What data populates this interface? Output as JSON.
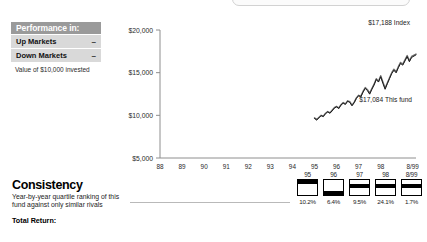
{
  "performance_panel": {
    "header": "Performance in:",
    "rows": [
      {
        "label": "Up Markets",
        "value": "–"
      },
      {
        "label": "Down Markets",
        "value": "–"
      }
    ],
    "note": "Value of $10,000 invested"
  },
  "consistency": {
    "title": "Consistency",
    "subtitle": "Year-by-year quartile ranking of this fund against only similar rivals",
    "total_return_label": "Total Return:"
  },
  "quartiles": {
    "cells": [
      {
        "year": "95",
        "quartile": 1,
        "pct": "10.2%"
      },
      {
        "year": "96",
        "quartile": 4,
        "pct": "6.4%"
      },
      {
        "year": "97",
        "quartile": 2,
        "pct": "9.5%"
      },
      {
        "year": "98",
        "quartile": 2,
        "pct": "24.1%"
      },
      {
        "year": "8/99",
        "quartile": 2,
        "pct": "1.7%"
      }
    ]
  },
  "chart_data": {
    "type": "line",
    "title": "",
    "xlabel": "",
    "ylabel": "",
    "ylim": [
      5000,
      20000
    ],
    "ytick_labels": [
      "$20,000",
      "$15,000",
      "$10,000",
      "$5,000"
    ],
    "ytick_values": [
      20000,
      15000,
      10000,
      5000
    ],
    "xtick_labels": [
      "88",
      "89",
      "90",
      "91",
      "92",
      "93",
      "94",
      "95",
      "96",
      "97",
      "98",
      "8/99"
    ],
    "grid": false,
    "legend": "annotations",
    "annotations": [
      {
        "text": "$17,188 Index",
        "value": 17188
      },
      {
        "text": "$17,084 This fund",
        "value": 17084
      }
    ],
    "series": [
      {
        "name": "Index",
        "color": "#6f6f6f",
        "x": [
          95.0,
          95.1,
          95.2,
          95.3,
          95.4,
          95.5,
          95.6,
          95.7,
          95.8,
          95.9,
          96.0,
          96.1,
          96.2,
          96.3,
          96.4,
          96.5,
          96.6,
          96.7,
          96.8,
          96.9,
          97.0,
          97.1,
          97.2,
          97.3,
          97.4,
          97.5,
          97.6,
          97.7,
          97.8,
          97.9,
          98.0,
          98.1,
          98.2,
          98.3,
          98.4,
          98.5,
          98.6,
          98.7,
          98.8,
          98.9,
          99.0,
          99.1,
          99.2,
          99.3,
          99.4,
          99.6
        ],
        "values": [
          9700,
          9500,
          9750,
          10000,
          9900,
          10250,
          10450,
          10300,
          10600,
          10900,
          11050,
          10850,
          11250,
          11500,
          11350,
          11700,
          11600,
          11200,
          11550,
          12050,
          12350,
          12250,
          12800,
          13250,
          13000,
          12600,
          13150,
          13650,
          14300,
          14000,
          14650,
          13900,
          13200,
          13800,
          14400,
          15000,
          15400,
          15100,
          15700,
          16200,
          16000,
          16500,
          17000,
          16400,
          16900,
          17188
        ]
      },
      {
        "name": "This fund",
        "color": "#1a1a1a",
        "x": [
          95.0,
          95.1,
          95.2,
          95.3,
          95.4,
          95.5,
          95.6,
          95.7,
          95.8,
          95.9,
          96.0,
          96.1,
          96.2,
          96.3,
          96.4,
          96.5,
          96.6,
          96.7,
          96.8,
          96.9,
          97.0,
          97.1,
          97.2,
          97.3,
          97.4,
          97.5,
          97.6,
          97.7,
          97.8,
          97.9,
          98.0,
          98.1,
          98.2,
          98.3,
          98.4,
          98.5,
          98.6,
          98.7,
          98.8,
          98.9,
          99.0,
          99.1,
          99.2,
          99.3,
          99.4,
          99.6
        ],
        "values": [
          9650,
          9450,
          9700,
          9960,
          9850,
          10200,
          10400,
          10250,
          10520,
          10850,
          11000,
          10800,
          11200,
          11430,
          11280,
          11650,
          11520,
          11120,
          11480,
          12000,
          12300,
          12150,
          12720,
          13150,
          12900,
          12480,
          13050,
          13550,
          14200,
          13900,
          14520,
          13750,
          13050,
          13700,
          14300,
          14900,
          15280,
          14980,
          15580,
          16080,
          15880,
          16380,
          16880,
          16280,
          16780,
          17084
        ]
      }
    ]
  }
}
